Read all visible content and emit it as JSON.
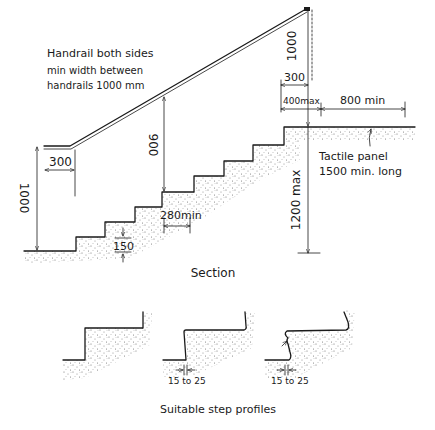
{
  "diagram": {
    "title_section": "Section",
    "title_profiles": "Suitable step profiles",
    "notes": {
      "handrail_line1": "Handrail both sides",
      "handrail_line2": "min width between",
      "handrail_line3": "handrails  1000 mm",
      "tactile_line1": "Tactile panel",
      "tactile_line2": "1500 min. long"
    },
    "dimensions": {
      "handrail_height_bottom": "1000",
      "handrail_extension_bottom": "300",
      "handrail_height_step": "900",
      "going": "280min",
      "riser": "150",
      "handrail_height_top": "1000",
      "handrail_extension_top": "300",
      "landing_offset": "400max",
      "landing_clear": "800 min",
      "flight_rise": "1200 max",
      "nosing_1": "15 to 25",
      "nosing_2": "15 to 25"
    },
    "colors": {
      "ink": "#1a1a1a",
      "stipple": "#555555",
      "background": "#ffffff"
    }
  }
}
